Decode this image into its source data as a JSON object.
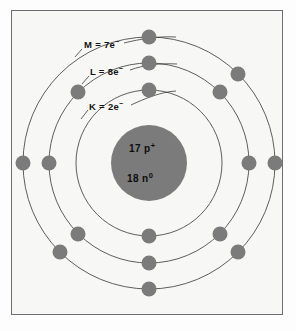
{
  "figure": {
    "frame": {
      "border_color": "#6e6e70",
      "background_color": "#f7f7f6"
    }
  },
  "nucleus": {
    "protons_label": "17 p",
    "protons_superscript": "+",
    "neutrons_label": "18 n",
    "neutrons_superscript": "0",
    "fill_color": "#7b7b7b",
    "center_x": 149,
    "center_y": 163,
    "radius": 38
  },
  "shells": [
    {
      "name": "K",
      "label_text": "K = 2e",
      "label_superscript": "−",
      "electron_count": 2,
      "radius": 73,
      "electron_angles_deg": [
        270,
        90
      ]
    },
    {
      "name": "L",
      "label_text": "L = 8e",
      "label_superscript": "−",
      "electron_count": 8,
      "radius": 100,
      "electron_angles_deg": [
        270,
        315,
        0,
        45,
        90,
        135,
        180,
        225
      ]
    },
    {
      "name": "M",
      "label_text": "M = 7e",
      "label_superscript": "−",
      "electron_count": 7,
      "radius": 126,
      "electron_angles_deg": [
        270,
        315,
        0,
        45,
        90,
        180,
        225
      ]
    }
  ],
  "electron": {
    "fill_color": "#7b7b7b",
    "radius": 7.5
  },
  "orbit_line": {
    "stroke_color": "#4c4c4c",
    "stroke_width": 0.9
  },
  "leader_lines": {
    "stroke_color": "#3a3a3a",
    "stroke_width": 0.8
  }
}
